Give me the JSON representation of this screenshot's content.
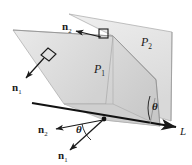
{
  "figure": {
    "background_color": "#ffffff",
    "stroke_color": "#1a1a1a",
    "plane_fill_light": "#e8e8e8",
    "plane_fill_mid": "#dcdcdc",
    "plane_fill_dark": "#c9c9c9",
    "plane_edge_color": "#9a9a9a"
  },
  "labels": {
    "plane1": {
      "text": "P",
      "sub": "1",
      "name": "plane-1-label"
    },
    "plane2": {
      "text": "P",
      "sub": "2",
      "name": "plane-2-label"
    },
    "normal2_top": {
      "text": "n",
      "sub": "2",
      "name": "normal-2-top-label"
    },
    "normal1_left": {
      "text": "n",
      "sub": "1",
      "name": "normal-1-left-label"
    },
    "normal2_bottom": {
      "text": "n",
      "sub": "2",
      "name": "normal-2-bottom-label"
    },
    "normal1_bottom": {
      "text": "n",
      "sub": "1",
      "name": "normal-1-bottom-label"
    },
    "theta_right": {
      "text": "θ",
      "name": "theta-right-label"
    },
    "theta_bottom": {
      "text": "θ",
      "name": "theta-bottom-label"
    },
    "line_l": {
      "text": "L",
      "name": "line-l-label"
    }
  },
  "geometry": {
    "plane2_polygon": "69,14 172,32 170,120 113,103 113,36",
    "plane1_polygon": "13,30 113,36 113,103 150,126 64,103",
    "plane1_upper_polygon": "13,30 113,36 113,103 64,103",
    "line_L": {
      "x1": 32,
      "y1": 103,
      "x2": 178,
      "y2": 128
    },
    "intersection_point": {
      "x": 104,
      "y": 120
    }
  },
  "arrows": {
    "normal2_top": {
      "from_x": 101,
      "from_y": 36,
      "to_x": 78,
      "to_y": 30,
      "square_x": 101,
      "square_y": 30
    },
    "normal1_left": {
      "from_x": 45,
      "from_y": 57,
      "to_x": 26,
      "to_y": 79,
      "square_x": 47,
      "square_y": 53
    },
    "normal2_bottom": {
      "from_x": 104,
      "from_y": 120,
      "to_x": 55,
      "to_y": 129
    },
    "normal1_bottom": {
      "from_x": 104,
      "from_y": 120,
      "to_x": 68,
      "to_y": 152
    }
  }
}
